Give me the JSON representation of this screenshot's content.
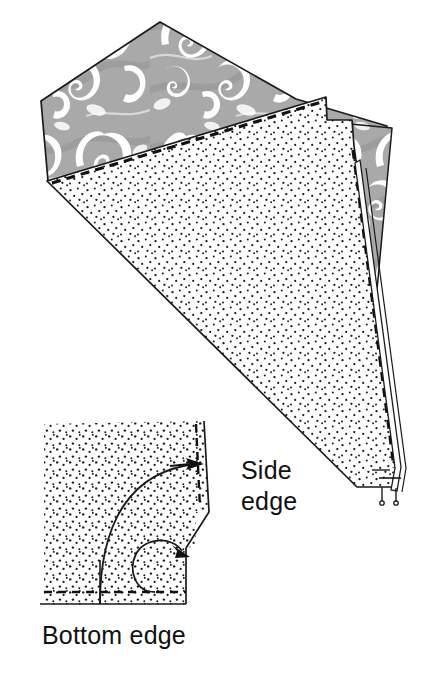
{
  "figure": {
    "domain_kind": "instructional-line-art-diagram",
    "canvas": {
      "width": 435,
      "height": 673,
      "background": "#ffffff"
    }
  },
  "colors": {
    "background": "#ffffff",
    "outline": "#1a1a1a",
    "patterned_fabric_gray": "#a9a9a9",
    "patterned_fabric_gray_dark": "#8f8f8f",
    "patterned_fabric_motif_white": "#ffffff",
    "stipple_dot": "#1a1a1a",
    "stipple_field": "#ffffff",
    "stitch_dash": "#111111",
    "arrow": "#111111",
    "label_text": "#111111"
  },
  "main_illustration": {
    "name": "folded-fabric-panel",
    "layers": [
      {
        "id": "patterned-backing",
        "label": "patterned fabric (wrong side out)",
        "fill": "#a9a9a9",
        "motif": "paisley swirl",
        "outline": "#1a1a1a"
      },
      {
        "id": "stippled-lining",
        "label": "stippled fabric panel",
        "fill": "#ffffff",
        "texture": "stipple dots",
        "outline": "#1a1a1a"
      },
      {
        "id": "side-gusset-wedge",
        "label": "narrow patterned wedge at side",
        "fill": "#a9a9a9",
        "outline": "#1a1a1a"
      },
      {
        "id": "binding-strip",
        "label": "narrow binding strip at point",
        "fill": "#ffffff",
        "outline": "#1a1a1a"
      }
    ],
    "stitching": {
      "style": "dashed",
      "top_seam_label": "basted seam along top edge",
      "side_seam_label": "basted seam along side edge"
    }
  },
  "detail_inset": {
    "name": "corner-rounding-detail",
    "fabric_texture": "stipple dots",
    "guides": [
      {
        "id": "large-arc",
        "label": "large curved cutting guide",
        "style": "solid"
      },
      {
        "id": "small-arc",
        "label": "small curved corner guide",
        "style": "solid"
      },
      {
        "id": "bottom-seam-dash",
        "label": "bottom seam allowance line",
        "style": "dashed"
      },
      {
        "id": "side-seam-dash",
        "label": "side seam allowance line",
        "style": "dashed"
      }
    ],
    "arrows": [
      {
        "id": "arrow-to-side-edge",
        "direction": "right",
        "points_to": "Side edge"
      },
      {
        "id": "arrow-to-small-arc",
        "direction": "down-right",
        "points_to": "corner curve"
      }
    ]
  },
  "labels": {
    "side_edge": {
      "line1": "Side",
      "line2": "edge"
    },
    "bottom_edge": "Bottom edge"
  }
}
